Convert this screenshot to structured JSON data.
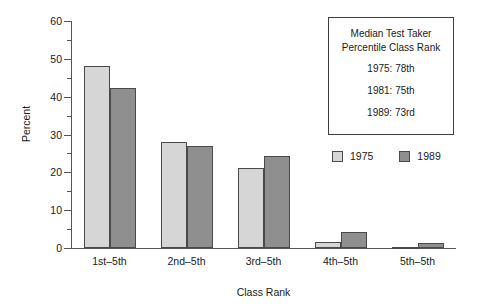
{
  "chart_data": {
    "type": "bar",
    "title": "",
    "xlabel": "Class Rank",
    "ylabel": "Percent",
    "ylim": [
      0,
      60
    ],
    "ytick_step": 10,
    "yminor_step": 5,
    "grid": false,
    "legend_position": "upper-right-below-box",
    "categories": [
      "1st–5th",
      "2nd–5th",
      "3rd–5th",
      "4th–5th",
      "5th–5th"
    ],
    "series": [
      {
        "name": "1975",
        "color": "#d6d6d6",
        "values": [
          48.1,
          28.1,
          21.2,
          1.5,
          0.3
        ]
      },
      {
        "name": "1989",
        "color": "#8f8f8f",
        "values": [
          42.3,
          27.0,
          24.4,
          4.2,
          1.2
        ]
      }
    ],
    "ytick_labels": [
      "0",
      "10",
      "20",
      "30",
      "40",
      "50",
      "60"
    ],
    "annotation": {
      "heading_line1": "Median Test Taker",
      "heading_line2": "Percentile Class Rank",
      "rows": [
        "1975: 78th",
        "1981: 75th",
        "1989: 73rd"
      ]
    }
  },
  "axes": {
    "y_title": "Percent",
    "x_title": "Class Rank"
  },
  "legend": {
    "entries": [
      {
        "label": "1975",
        "color": "#d6d6d6"
      },
      {
        "label": "1989",
        "color": "#8f8f8f"
      }
    ]
  },
  "colors": {
    "series_1975": "#d6d6d6",
    "series_1989": "#8f8f8f",
    "axis": "#555555",
    "bar_outline": "#4a4a4a",
    "text": "#1a1a1a",
    "background": "#ffffff"
  }
}
